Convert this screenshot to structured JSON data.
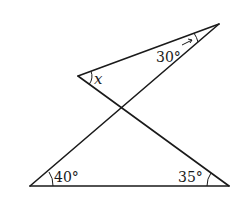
{
  "diagram": {
    "type": "geometry",
    "points": {
      "A": {
        "x": 30,
        "y": 186
      },
      "B": {
        "x": 229,
        "y": 186
      },
      "C": {
        "x": 219,
        "y": 24
      },
      "D": {
        "x": 78,
        "y": 76
      },
      "P": {
        "x": 122,
        "y": 109
      }
    },
    "segments": [
      {
        "from": "A",
        "to": "B"
      },
      {
        "from": "A",
        "to": "C"
      },
      {
        "from": "D",
        "to": "C"
      },
      {
        "from": "D",
        "to": "B"
      }
    ],
    "angles": {
      "top": {
        "label": "30°",
        "vertex": "C"
      },
      "x": {
        "label": "x",
        "vertex": "D"
      },
      "bottom_left": {
        "label": "40°",
        "vertex": "A"
      },
      "bottom_right": {
        "label": "35°",
        "vertex": "B"
      }
    }
  }
}
